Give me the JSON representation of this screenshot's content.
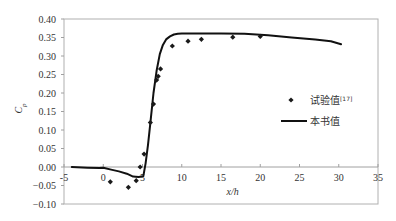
{
  "chart_data": {
    "type": "scatter",
    "title": "",
    "xlabel": "x/h",
    "ylabel": "C_p",
    "ylabel_main": "C",
    "ylabel_sub": "p",
    "xlim": [
      -5,
      35
    ],
    "ylim": [
      -0.1,
      0.4
    ],
    "x_ticks": [
      -5,
      0,
      5,
      10,
      15,
      20,
      25,
      30,
      35
    ],
    "x_tick_labels": [
      "-5",
      "0",
      "5",
      "10",
      "15",
      "20",
      "25",
      "30",
      "35"
    ],
    "y_ticks": [
      0.4,
      0.35,
      0.3,
      0.25,
      0.2,
      0.15,
      0.1,
      0.05,
      0.0,
      -0.05,
      -0.1
    ],
    "y_tick_labels": [
      "0.40",
      "0.35",
      "0.30",
      "0.25",
      "0.20",
      "0.15",
      "0.10",
      "0.05",
      "0.00",
      "−0.05",
      "−0.10"
    ],
    "grid": false,
    "legend_position": "right",
    "series": [
      {
        "name": "试验值[17]",
        "legend_label": "试验值",
        "legend_superscript": "[17]",
        "kind": "scatter",
        "marker": "diamond",
        "color": "#1a1a1a",
        "x": [
          0.9,
          3.2,
          4.2,
          4.7,
          5.2,
          6.0,
          6.4,
          6.8,
          7.0,
          7.3,
          8.8,
          10.8,
          12.5,
          16.5,
          20.0
        ],
        "y": [
          -0.04,
          -0.055,
          -0.037,
          0.0,
          0.035,
          0.12,
          0.17,
          0.235,
          0.245,
          0.265,
          0.327,
          0.34,
          0.345,
          0.351,
          0.353
        ]
      },
      {
        "name": "本书值",
        "legend_label": "本书值",
        "kind": "line",
        "color": "#111111",
        "x": [
          -4.0,
          -2.0,
          -0.5,
          0.0,
          1.0,
          2.0,
          3.0,
          3.8,
          4.5,
          5.1,
          5.4,
          5.7,
          6.0,
          6.4,
          6.8,
          7.2,
          7.6,
          8.0,
          8.5,
          9.0,
          9.5,
          10.0,
          12.0,
          15.0,
          18.0,
          21.0,
          24.0,
          27.0,
          29.0,
          30.3
        ],
        "y": [
          0.0,
          -0.002,
          -0.003,
          -0.002,
          -0.007,
          -0.012,
          -0.018,
          -0.026,
          -0.027,
          -0.025,
          0.01,
          0.06,
          0.12,
          0.2,
          0.26,
          0.305,
          0.33,
          0.345,
          0.353,
          0.358,
          0.36,
          0.361,
          0.361,
          0.361,
          0.36,
          0.356,
          0.35,
          0.345,
          0.34,
          0.332
        ]
      }
    ]
  }
}
